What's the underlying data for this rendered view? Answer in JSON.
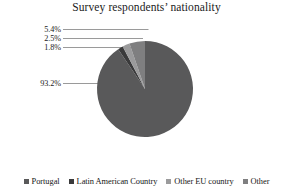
{
  "chart_data": {
    "type": "pie",
    "title": "Survey respondents’ nationality",
    "categories": [
      "Portugal",
      "Latin American Country",
      "Other EU country",
      "Other"
    ],
    "values": [
      93.2,
      1.8,
      2.5,
      5.4
    ],
    "value_labels": [
      "93.2%",
      "1.8%",
      "2.5%",
      "5.4%"
    ],
    "unit": "%",
    "colors": [
      "#59595a",
      "#3a3a3b",
      "#9b9b9c",
      "#7f7f80"
    ],
    "legend_position": "bottom",
    "grid": false,
    "xlabel": "",
    "ylabel": "",
    "start_angle_deg": -90,
    "direction": "clockwise"
  },
  "title": {
    "text": "Survey respondents’ nationality"
  },
  "labels": [
    {
      "id": "label-other",
      "text": "5.4%"
    },
    {
      "id": "label-other-eu",
      "text": "2.5%"
    },
    {
      "id": "label-latin-american",
      "text": "1.8%"
    },
    {
      "id": "label-portugal",
      "text": "93.2%"
    }
  ],
  "legend": {
    "items": [
      {
        "label": "Portugal",
        "color": "#59595a"
      },
      {
        "label": "Latin American Country",
        "color": "#3a3a3b"
      },
      {
        "label": "Other EU country",
        "color": "#9b9b9c"
      },
      {
        "label": "Other",
        "color": "#7f7f80"
      }
    ]
  },
  "theme": {
    "background": "#ffffff",
    "text": "#1b1b1b",
    "leader_line": "#8b8b8b"
  }
}
